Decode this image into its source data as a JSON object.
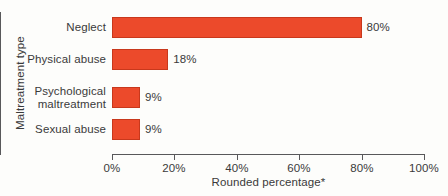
{
  "chart_data": {
    "type": "bar",
    "orientation": "horizontal",
    "title": "",
    "categories": [
      "Neglect",
      "Physical abuse",
      "Psychological\nmaltreatment",
      "Sexual abuse"
    ],
    "values": [
      80,
      18,
      9,
      9
    ],
    "value_labels": [
      "80%",
      "18%",
      "9%",
      "9%"
    ],
    "xlabel": "Rounded percentage*",
    "ylabel": "Maltreatment type",
    "xlim": [
      0,
      100
    ],
    "xticks": [
      0,
      20,
      40,
      60,
      80,
      100
    ],
    "xtick_labels": [
      "0%",
      "20%",
      "40%",
      "60%",
      "80%",
      "100%"
    ],
    "grid": false,
    "legend": null,
    "bar_color": "#ec4a2b",
    "bar_border_color": "#c8381c",
    "axis_color": "#58585a",
    "text_color": "#3a3a3a",
    "background_color": "#fdfdfb"
  }
}
